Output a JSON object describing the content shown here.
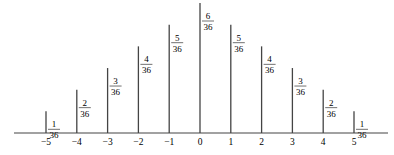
{
  "chart_data": {
    "type": "bar",
    "title": "",
    "xlabel": "",
    "ylabel": "",
    "categories": [
      "-5",
      "-4",
      "-3",
      "-2",
      "-1",
      "0",
      "1",
      "2",
      "3",
      "4",
      "5"
    ],
    "values": [
      0.0278,
      0.0556,
      0.0833,
      0.1111,
      0.1389,
      0.1667,
      0.1389,
      0.1111,
      0.0833,
      0.0556,
      0.0278
    ],
    "labels": [
      {
        "num": "1",
        "den": "36"
      },
      {
        "num": "2",
        "den": "36"
      },
      {
        "num": "3",
        "den": "36"
      },
      {
        "num": "4",
        "den": "36"
      },
      {
        "num": "5",
        "den": "36"
      },
      {
        "num": "6",
        "den": "36"
      },
      {
        "num": "5",
        "den": "36"
      },
      {
        "num": "4",
        "den": "36"
      },
      {
        "num": "3",
        "den": "36"
      },
      {
        "num": "2",
        "den": "36"
      },
      {
        "num": "1",
        "den": "36"
      }
    ],
    "tick_labels": [
      "−5",
      "−4",
      "−3",
      "−2",
      "−1",
      "0",
      "1",
      "2",
      "3",
      "4",
      "5"
    ],
    "grid": false,
    "legend": null,
    "ylim": [
      0,
      0.1667
    ]
  }
}
